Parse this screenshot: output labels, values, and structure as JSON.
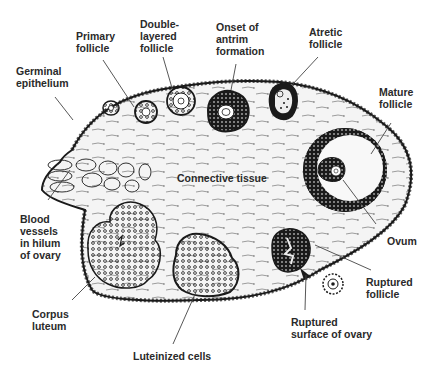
{
  "diagram": {
    "center_label": "Connective tissue",
    "labels": {
      "germinal_epithelium": "Germinal\nepithelium",
      "primary_follicle": "Primary\nfollicle",
      "double_layered_follicle": "Double-\nlayered\nfollicle",
      "onset_antrim": "Onset of\nantrim\nformation",
      "atretic_follicle": "Atretic\nfollicle",
      "mature_follicle": "Mature\nfollicle",
      "blood_vessels": "Blood\nvessels\nin hilum\nof ovary",
      "ovum": "Ovum",
      "ruptured_follicle": "Ruptured\nfollicle",
      "ruptured_surface": "Ruptured\nsurface of ovary",
      "corpus_luteum": "Corpus\nluteum",
      "luteinized_cells": "Luteinized cells"
    },
    "colors": {
      "background": "#ffffff",
      "ink": "#1a1a1a",
      "stroma": "#f2f2f2",
      "text": "#2a2a2a"
    }
  }
}
